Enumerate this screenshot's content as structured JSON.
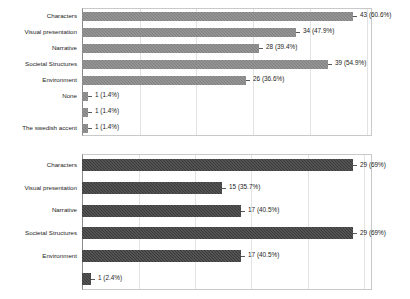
{
  "figure": {
    "background_color": "#ffffff",
    "panel_count": 2
  },
  "chart_data": [
    {
      "id": "top-chart",
      "type": "bar",
      "orientation": "horizontal",
      "title": "",
      "subtitle": "",
      "xlabel": "",
      "ylabel": "",
      "xlim": [
        0,
        46
      ],
      "grid": true,
      "grid_axis": "x",
      "gridlines_at": [
        9,
        18,
        27,
        36,
        45
      ],
      "legend": null,
      "bar_color": "#808080",
      "bar_pattern": "dithered-crosshatch",
      "categories": [
        "Characters",
        "Visual presentation",
        "Narrative",
        "Societal Structures",
        "Environment",
        "None",
        "",
        "The swedish accent"
      ],
      "values": [
        43,
        34,
        28,
        39,
        26,
        1,
        1,
        1
      ],
      "percents": [
        60.6,
        47.9,
        39.4,
        54.9,
        36.6,
        1.4,
        1.4,
        1.4
      ],
      "data_labels": [
        "43 (60.6%)",
        "34 (47.9%)",
        "28 (39.4%)",
        "39 (54.9%)",
        "26 (36.6%)",
        "1 (1.4%)",
        "1 (1.4%)",
        "1 (1.4%)"
      ]
    },
    {
      "id": "bottom-chart",
      "type": "bar",
      "orientation": "horizontal",
      "title": "",
      "subtitle": "",
      "xlabel": "",
      "ylabel": "",
      "xlim": [
        0,
        31
      ],
      "grid": true,
      "grid_axis": "x",
      "gridlines_at": [
        6,
        12,
        18,
        24,
        30
      ],
      "legend": null,
      "bar_color": "#3b3b3b",
      "bar_pattern": "dithered-crosshatch",
      "categories": [
        "Characters",
        "Visual presentation",
        "Narrative",
        "Societal Structures",
        "Environment",
        ""
      ],
      "values": [
        29,
        15,
        17,
        29,
        17,
        1
      ],
      "percents": [
        69,
        35.7,
        40.5,
        69,
        40.5,
        2.4
      ],
      "data_labels": [
        "29 (69%)",
        "15 (35.7%)",
        "17 (40.5%)",
        "29 (69%)",
        "17 (40.5%)",
        "1 (2.4%)"
      ]
    }
  ]
}
